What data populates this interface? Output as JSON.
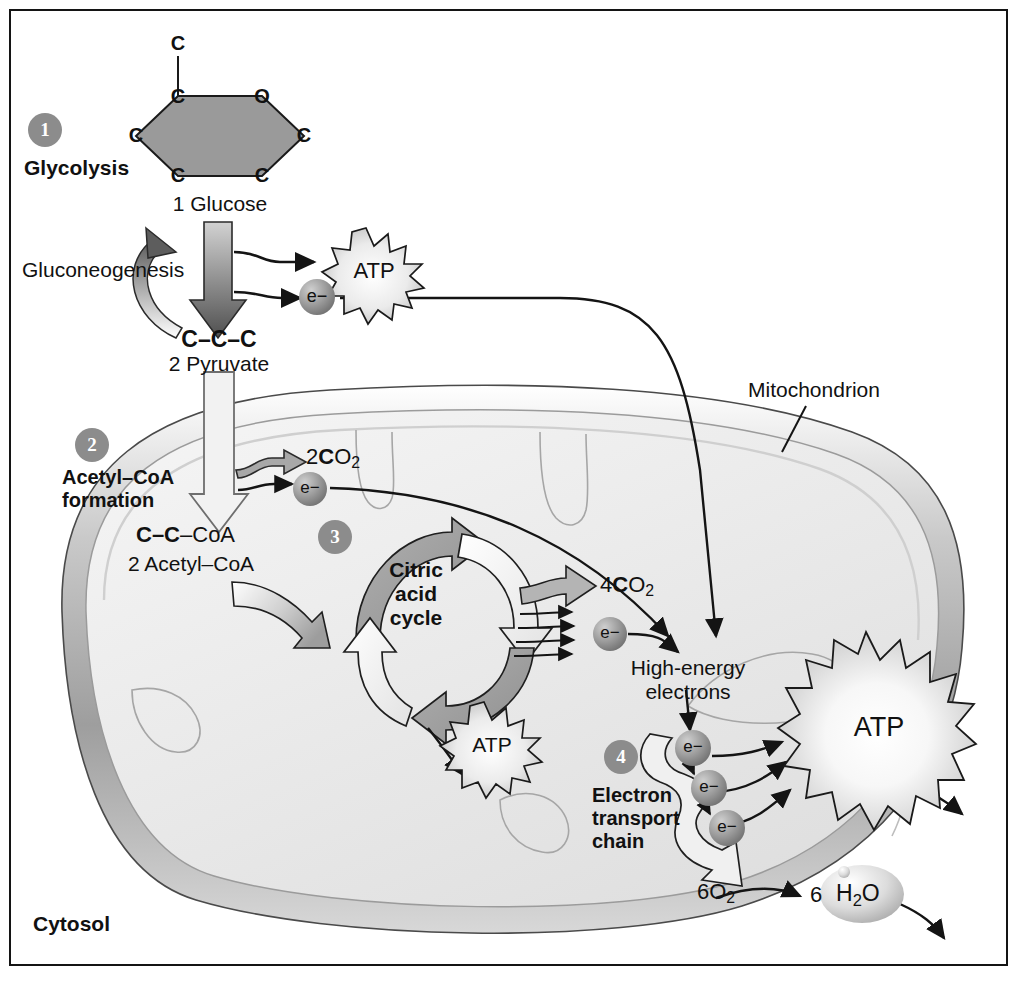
{
  "figure": {
    "compartments": {
      "cytosol_label": "Cytosol",
      "mitochondrion_label": "Mitochondrion"
    },
    "colors": {
      "badge_gray": "#8c8c8c",
      "arrow_gray": "#9a9a9a",
      "arrow_dark": "#4a4a4a",
      "molecule_gray": "#8e8e8e",
      "outline": "#1a1a1a",
      "membrane_outer": "#b9b9b9",
      "matrix_fill": "#ededed"
    },
    "steps": [
      {
        "number": "1",
        "label": "Glycolysis"
      },
      {
        "number": "2",
        "label": "Acetyl–CoA\nformation"
      },
      {
        "number": "3",
        "label": "Citric\nacid\ncycle"
      },
      {
        "number": "4",
        "label": "Electron\ntransport\nchain"
      }
    ],
    "molecules": {
      "glucose_ring_atoms": [
        "C",
        "C",
        "O",
        "C",
        "C",
        "C",
        "C"
      ],
      "glucose_label": "1 Glucose",
      "pyruvate_formula": "C–C–C",
      "pyruvate_label": "2 Pyruvate",
      "acetyl_coa_formula_bold": "C–C",
      "acetyl_coa_formula_tail": "–CoA",
      "acetyl_coa_label": "2 Acetyl–CoA",
      "co2_acetyl": "2CO2",
      "co2_citric": "4CO2",
      "oxygen": "6O2",
      "water_count": "6",
      "water": "H2O",
      "electron": "e−",
      "atp": "ATP",
      "high_energy_electrons": "High-energy\nelectrons"
    },
    "pathways": {
      "gluconeogenesis_label": "Gluconeogenesis"
    },
    "atp_outputs": [
      "ATP",
      "ATP",
      "ATP"
    ],
    "electron_carriers": [
      "e−",
      "e−",
      "e−",
      "e−",
      "e−",
      "e−"
    ]
  }
}
